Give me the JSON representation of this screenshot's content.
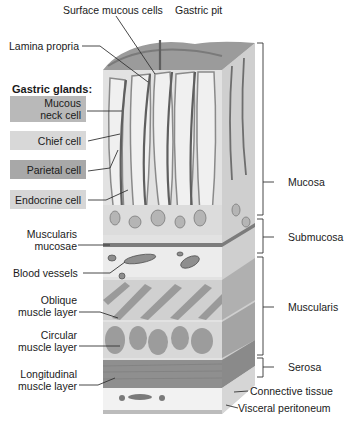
{
  "diagram": {
    "top_labels": {
      "surface_mucous_cells": "Surface mucous cells",
      "gastric_pit": "Gastric pit",
      "lamina_propria": "Lamina propria"
    },
    "gastric_glands": {
      "heading": "Gastric glands:",
      "mucous_neck_line1": "Mucous",
      "mucous_neck_line2": "neck cell",
      "chief": "Chief cell",
      "parietal": "Parietal cell",
      "endocrine": "Endocrine cell"
    },
    "left_labels": {
      "muscularis_mucosae_line1": "Muscularis",
      "muscularis_mucosae_line2": "mucosae",
      "blood_vessels": "Blood vessels",
      "oblique_line1": "Oblique",
      "oblique_line2": "muscle layer",
      "circular_line1": "Circular",
      "circular_line2": "muscle layer",
      "longitudinal_line1": "Longitudinal",
      "longitudinal_line2": "muscle layer"
    },
    "right_labels": {
      "mucosa": "Mucosa",
      "submucosa": "Submucosa",
      "muscularis": "Muscularis",
      "serosa": "Serosa",
      "connective_tissue": "Connective tissue",
      "visceral_peritoneum": "Visceral peritoneum"
    },
    "colors": {
      "box_mucous_neck": "#b9b9b9",
      "box_chief": "#d8d8d8",
      "box_parietal": "#a8a8a8",
      "box_endocrine": "#d6d6d6",
      "tissue_light": "#e4e4e4",
      "tissue_mid": "#a9a9a9",
      "tissue_dark": "#6e6e6e",
      "leader_line": "#333333"
    }
  }
}
